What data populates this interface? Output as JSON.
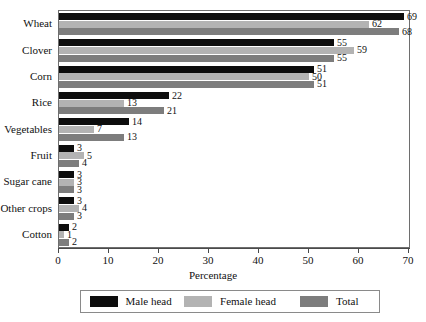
{
  "chart_data": {
    "type": "bar",
    "orientation": "horizontal",
    "title": "",
    "subtitle": "",
    "xlabel": "Percentage",
    "ylabel": "",
    "xlim": [
      0,
      70
    ],
    "xticks": [
      0,
      10,
      20,
      30,
      40,
      50,
      60,
      70
    ],
    "grid": false,
    "legend_position": "bottom",
    "categories": [
      "Wheat",
      "Clover",
      "Corn",
      "Rice",
      "Vegetables",
      "Fruit",
      "Sugar cane",
      "Other crops",
      "Cotton"
    ],
    "series": [
      {
        "name": "Male head",
        "color": "#0d0d0d",
        "values": [
          69,
          55,
          51,
          22,
          14,
          3,
          3,
          3,
          2
        ]
      },
      {
        "name": "Female head",
        "color": "#b3b3b3",
        "values": [
          62,
          59,
          50,
          13,
          7,
          5,
          3,
          4,
          1
        ]
      },
      {
        "name": "Total",
        "color": "#7d7d7d",
        "values": [
          68,
          55,
          51,
          21,
          13,
          4,
          3,
          3,
          2
        ]
      }
    ]
  },
  "legend": {
    "items": [
      {
        "label": "Male head",
        "color": "#0d0d0d"
      },
      {
        "label": "Female head",
        "color": "#b3b3b3"
      },
      {
        "label": "Total",
        "color": "#7d7d7d"
      }
    ]
  },
  "axis": {
    "x_title": "Percentage"
  },
  "colors": {
    "frame": "#6e6e6e",
    "axis": "#4a4a4a",
    "text": "#111111",
    "background": "#ffffff"
  }
}
